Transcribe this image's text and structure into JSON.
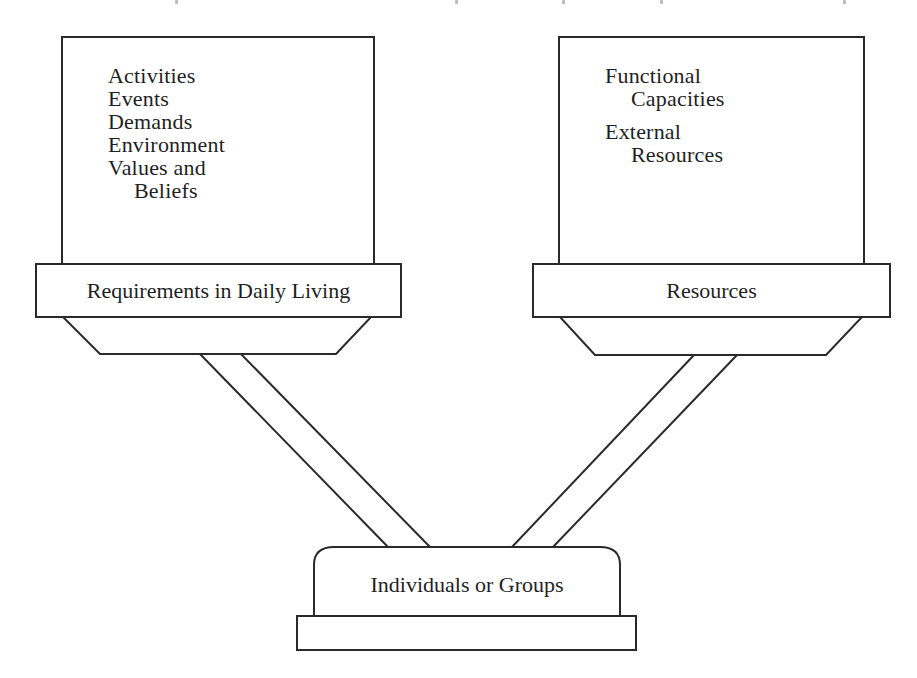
{
  "diagram": {
    "left_panel": {
      "items": [
        "Activities",
        "Events",
        "Demands",
        "Environment",
        "Values and",
        "Beliefs"
      ],
      "label": "Requirements in Daily Living"
    },
    "right_panel": {
      "items": [
        "Functional",
        "Capacities",
        "External",
        "Resources"
      ],
      "label": "Resources"
    },
    "base": {
      "label": "Individuals or Groups"
    },
    "colors": {
      "stroke": "#2a2a2a",
      "background": "#ffffff",
      "text": "#1f1f1f"
    }
  }
}
